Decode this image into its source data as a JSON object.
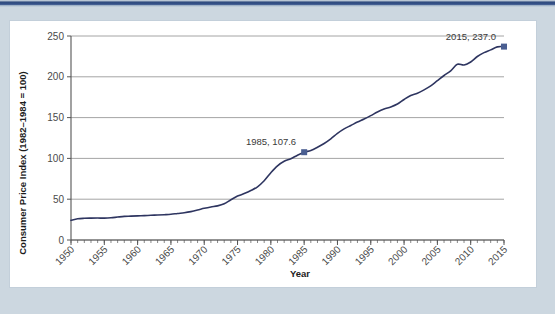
{
  "theme": {
    "frame_top_bar": "#35518a",
    "frame_surround": "#ccd7e0",
    "panel_background": "#ffffff",
    "panel_border": "#c3cfda",
    "line_color": "#2e3560",
    "marker_color": "#4a5e91",
    "gridline_color": "#9a9a9a",
    "axis_color": "#555555",
    "tick_text_color": "#4a4a4a",
    "axis_title_color": "#1c1c1c"
  },
  "chart_data": {
    "type": "line",
    "title": "",
    "xlabel": "Year",
    "ylabel": "Consumer Price Index (1982–1984 = 100)",
    "xlim": [
      1950,
      2015
    ],
    "ylim": [
      0,
      250
    ],
    "grid": true,
    "legend": "none",
    "y_ticks": [
      0,
      50,
      100,
      150,
      200,
      250
    ],
    "y_tick_labels": [
      "0",
      "50",
      "100",
      "150",
      "200",
      "250"
    ],
    "x_ticks": [
      1950,
      1955,
      1960,
      1965,
      1970,
      1975,
      1980,
      1985,
      1990,
      1995,
      2000,
      2005,
      2010,
      2015
    ],
    "x_tick_labels": [
      "1950",
      "1955",
      "1960",
      "1965",
      "1970",
      "1975",
      "1980",
      "1985",
      "1990",
      "1995",
      "2000",
      "2005",
      "2010",
      "2015"
    ],
    "x_minor_tick_interval": 1,
    "series": [
      {
        "name": "Consumer Price Index",
        "x": [
          1950,
          1951,
          1952,
          1953,
          1954,
          1955,
          1956,
          1957,
          1958,
          1959,
          1960,
          1961,
          1962,
          1963,
          1964,
          1965,
          1966,
          1967,
          1968,
          1969,
          1970,
          1971,
          1972,
          1973,
          1974,
          1975,
          1976,
          1977,
          1978,
          1979,
          1980,
          1981,
          1982,
          1983,
          1984,
          1985,
          1986,
          1987,
          1988,
          1989,
          1990,
          1991,
          1992,
          1993,
          1994,
          1995,
          1996,
          1997,
          1998,
          1999,
          2000,
          2001,
          2002,
          2003,
          2004,
          2005,
          2006,
          2007,
          2008,
          2009,
          2010,
          2011,
          2012,
          2013,
          2014,
          2015
        ],
        "values": [
          24.1,
          26.0,
          26.6,
          26.8,
          26.9,
          26.8,
          27.2,
          28.1,
          28.9,
          29.2,
          29.6,
          29.9,
          30.3,
          30.6,
          31.0,
          31.5,
          32.5,
          33.4,
          34.8,
          36.7,
          38.8,
          40.5,
          41.8,
          44.4,
          49.3,
          53.8,
          56.9,
          60.6,
          65.2,
          72.6,
          82.4,
          90.9,
          96.5,
          99.6,
          103.9,
          107.6,
          109.6,
          113.6,
          118.3,
          124.0,
          130.7,
          136.2,
          140.3,
          144.5,
          148.2,
          152.4,
          156.9,
          160.5,
          163.0,
          166.6,
          172.2,
          177.1,
          179.9,
          184.0,
          188.9,
          195.3,
          201.6,
          207.3,
          215.3,
          214.5,
          218.1,
          224.9,
          229.6,
          233.0,
          236.7,
          237.0
        ]
      }
    ],
    "annotations": [
      {
        "label": "1985, 107.6",
        "x": 1985,
        "y": 107.6,
        "marker": "square"
      },
      {
        "label": "2015, 237.0",
        "x": 2015,
        "y": 237.0,
        "marker": "square"
      }
    ]
  }
}
